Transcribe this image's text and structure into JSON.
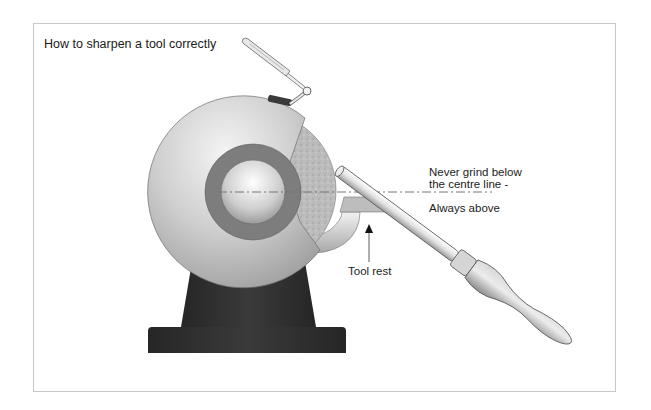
{
  "figure": {
    "title": "How to sharpen a tool correctly",
    "annotations": {
      "never_grind_line1": "Never grind below",
      "never_grind_line2": "the centre line -",
      "always_above": "Always above",
      "tool_rest": "Tool rest"
    },
    "parts": [
      "grinder guard",
      "grinding wheel",
      "wheel hub",
      "eye shield arm",
      "tool rest",
      "pedestal base",
      "turning tool shaft",
      "ferrule",
      "wooden handle",
      "centre line"
    ],
    "colors": {
      "frame_border": "#c8c8c8",
      "base": "#2e2e2e",
      "guard": "#bdbdbd",
      "hub_ring": "#7a7a7a",
      "stone": "#b9b9b9",
      "centre_line": "#777777",
      "text": "#222222"
    }
  }
}
